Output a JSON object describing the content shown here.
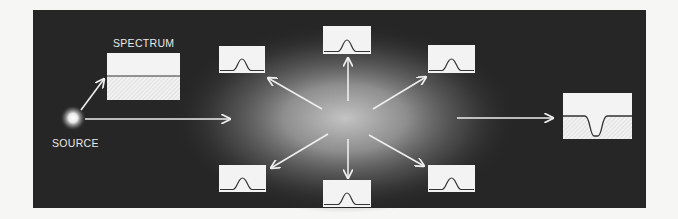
{
  "diagram": {
    "labels": {
      "spectrum": "SPECTRUM",
      "source": "SOURCE"
    },
    "colors": {
      "page_background": "#f6f6f4",
      "panel_background": "#262626",
      "cloud_glow": "#bdbdbd",
      "arrow": "#eeeeee",
      "box_fill": "#f3f3f3",
      "curve": "#333333"
    },
    "nodes": [
      {
        "id": "source",
        "type": "light-source",
        "label_ref": "source"
      },
      {
        "id": "spectrum-continuous",
        "type": "spectrum-box",
        "profile": "continuous",
        "label_ref": "spectrum"
      },
      {
        "id": "gas-cloud",
        "type": "glowing-cloud"
      },
      {
        "id": "emission-top-left",
        "type": "spectrum-box",
        "profile": "emission-line"
      },
      {
        "id": "emission-top",
        "type": "spectrum-box",
        "profile": "emission-line"
      },
      {
        "id": "emission-top-right",
        "type": "spectrum-box",
        "profile": "emission-line"
      },
      {
        "id": "emission-bottom-left",
        "type": "spectrum-box",
        "profile": "emission-line"
      },
      {
        "id": "emission-bottom",
        "type": "spectrum-box",
        "profile": "emission-line"
      },
      {
        "id": "emission-bottom-right",
        "type": "spectrum-box",
        "profile": "emission-line"
      },
      {
        "id": "absorption",
        "type": "spectrum-box",
        "profile": "absorption-line"
      }
    ],
    "edges": [
      {
        "from": "source",
        "to": "spectrum-continuous"
      },
      {
        "from": "source",
        "to": "gas-cloud"
      },
      {
        "from": "gas-cloud",
        "to": "emission-top-left"
      },
      {
        "from": "gas-cloud",
        "to": "emission-top"
      },
      {
        "from": "gas-cloud",
        "to": "emission-top-right"
      },
      {
        "from": "gas-cloud",
        "to": "emission-bottom-left"
      },
      {
        "from": "gas-cloud",
        "to": "emission-bottom"
      },
      {
        "from": "gas-cloud",
        "to": "emission-bottom-right"
      },
      {
        "from": "gas-cloud",
        "to": "absorption"
      }
    ]
  }
}
